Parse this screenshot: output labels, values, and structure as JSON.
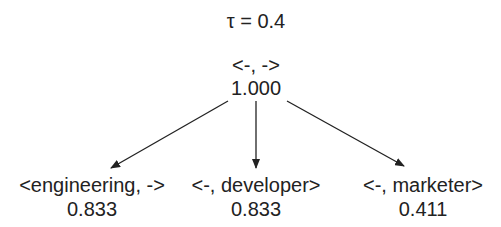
{
  "threshold_label": "τ = 0.4",
  "root": {
    "label": "<-, ->",
    "score": "1.000"
  },
  "children": [
    {
      "label": "<engineering, ->",
      "score": "0.833"
    },
    {
      "label": "<-, developer>",
      "score": "0.833"
    },
    {
      "label": "<-, marketer>",
      "score": "0.411"
    }
  ]
}
